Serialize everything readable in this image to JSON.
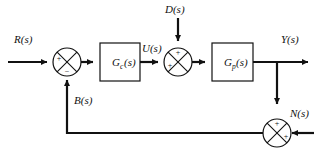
{
  "diagram": {
    "type": "control-block-diagram",
    "background_color": "#ffffff",
    "line_color": "#111111",
    "signals": {
      "reference": "R(s)",
      "control": "U(s)",
      "disturbance": "D(s)",
      "output": "Y(s)",
      "feedback": "B(s)",
      "noise": "N(s)"
    },
    "blocks": [
      {
        "id": "controller",
        "base": "G",
        "subscript": "c",
        "arg": "(s)",
        "label": "G_c(s)"
      },
      {
        "id": "plant",
        "base": "G",
        "subscript": "p",
        "arg": "(s)",
        "label": "G_p(s)"
      }
    ],
    "summing_junctions": [
      {
        "id": "error-junction",
        "signs": {
          "left": "+",
          "bottom": "−"
        }
      },
      {
        "id": "disturbance-junction",
        "signs": {
          "left": "+",
          "top": "+"
        }
      },
      {
        "id": "noise-junction",
        "signs": {
          "top": "+",
          "right": "+"
        }
      }
    ]
  }
}
